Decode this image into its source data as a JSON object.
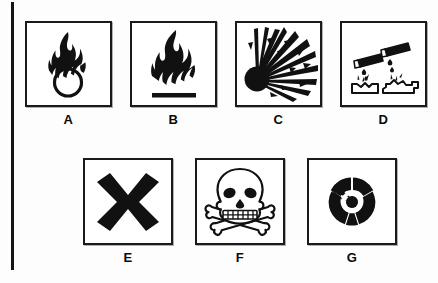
{
  "figure": {
    "background_color": "#fdfdfd",
    "ink_color": "#141414",
    "page_edge_rule": "vertical-black-rule-left"
  },
  "rows": [
    {
      "name": "row-1",
      "items": [
        {
          "label": "A",
          "icon": "oxidising-flame-over-circle-icon",
          "meaning": "oxidising"
        },
        {
          "label": "B",
          "icon": "flammable-flame-icon",
          "meaning": "flammable"
        },
        {
          "label": "C",
          "icon": "explosive-exploding-bomb-icon",
          "meaning": "explosive"
        },
        {
          "label": "D",
          "icon": "corrosive-acid-drip-icon",
          "meaning": "corrosive"
        }
      ]
    },
    {
      "name": "row-2",
      "items": [
        {
          "label": "E",
          "icon": "harmful-irritant-cross-icon",
          "meaning": "harmful / irritant"
        },
        {
          "label": "F",
          "icon": "toxic-skull-and-crossbones-icon",
          "meaning": "toxic"
        },
        {
          "label": "G",
          "icon": "radioactive-trefoil-icon",
          "meaning": "radioactive"
        }
      ]
    }
  ]
}
